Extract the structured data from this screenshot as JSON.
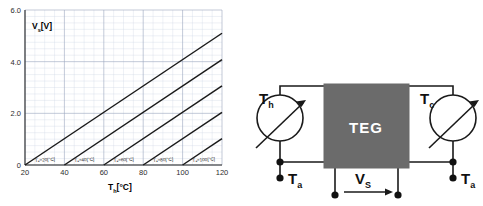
{
  "figure": {
    "panels": [
      "chart-panel",
      "diagram-panel"
    ]
  },
  "chart_data": {
    "type": "line",
    "title": "",
    "xlabel": "T_h[°C]",
    "ylabel": "V_s[V]",
    "xlim": [
      20,
      120
    ],
    "ylim": [
      0,
      6.0
    ],
    "xticks": [
      20,
      40,
      60,
      80,
      100,
      120
    ],
    "xtick_labels": [
      "20",
      "40",
      "60",
      "80",
      "100",
      "120"
    ],
    "yticks": [
      0,
      2.0,
      4.0,
      6.0
    ],
    "ytick_labels": [
      "0",
      "2.0",
      "4.0",
      "6.0"
    ],
    "x_minor_step": 5,
    "y_minor_step": 0.25,
    "grid": true,
    "legend_position": "inline-along-curves",
    "series": [
      {
        "name": "Ta=20[°C]",
        "label": "Tₐ=20[°C]",
        "x": [
          20,
          120
        ],
        "y": [
          0,
          5.1
        ],
        "x_intercept": 20,
        "slope": 0.051
      },
      {
        "name": "Ta=40[°C]",
        "label": "Tₐ=40[°C]",
        "x": [
          40,
          120
        ],
        "y": [
          0,
          4.08
        ],
        "x_intercept": 40,
        "slope": 0.051
      },
      {
        "name": "Ta=60[°C]",
        "label": "Tₐ=60[°C]",
        "x": [
          60,
          120
        ],
        "y": [
          0,
          3.06
        ],
        "x_intercept": 60,
        "slope": 0.051
      },
      {
        "name": "Ta=80[°C]",
        "label": "Tₐ=80[°C]",
        "x": [
          80,
          120
        ],
        "y": [
          0,
          2.04
        ],
        "x_intercept": 80,
        "slope": 0.051
      },
      {
        "name": "Ta=100[°C]",
        "label": "Tₐ=100[°C]",
        "x": [
          100,
          120
        ],
        "y": [
          0,
          1.02
        ],
        "x_intercept": 100,
        "slope": 0.051
      }
    ]
  },
  "chart": {
    "ylabel_main": "V",
    "ylabel_sub": "s",
    "ylabel_unit": "[V]",
    "xlabel_main": "T",
    "xlabel_sub": "h",
    "xlabel_unit": "[°C]"
  },
  "diagram": {
    "block_label": "TEG",
    "hot_side": {
      "main": "T",
      "sub": "h"
    },
    "cold_side": {
      "main": "T",
      "sub": "c"
    },
    "ambient_left": {
      "main": "T",
      "sub": "a"
    },
    "ambient_right": {
      "main": "T",
      "sub": "a"
    },
    "output_voltage": {
      "main": "V",
      "sub": "S"
    },
    "colors": {
      "block_fill": "#6b6b6b",
      "block_text": "#ffffff",
      "wire": "#1a1a1a",
      "node": "#111111"
    }
  }
}
